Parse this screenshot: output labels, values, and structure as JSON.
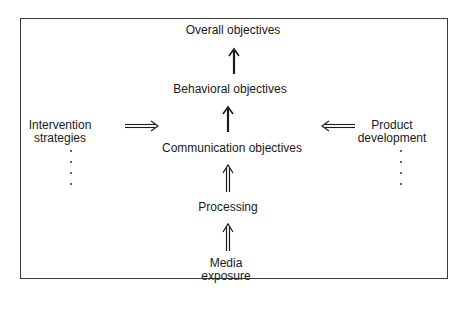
{
  "diagram": {
    "type": "flow-hierarchy",
    "central_chain": [
      {
        "id": "overall",
        "label": "Overall objectives"
      },
      {
        "id": "behavioral",
        "label": "Behavioral objectives"
      },
      {
        "id": "communication",
        "label": "Communication objectives"
      },
      {
        "id": "processing",
        "label": "Processing"
      },
      {
        "id": "media",
        "label_line1": "Media",
        "label_line2": "exposure"
      }
    ],
    "left_input": {
      "label_line1": "Intervention",
      "label_line2": "strategies",
      "continuation": "vertical dots",
      "arrow_direction": "right",
      "target": "Communication objectives"
    },
    "right_input": {
      "label_line1": "Product",
      "label_line2": "development",
      "continuation": "vertical dots",
      "arrow_direction": "left",
      "target": "Communication objectives"
    },
    "edges": [
      {
        "from": "Media exposure",
        "to": "Processing",
        "style": "hollow double-line arrow"
      },
      {
        "from": "Processing",
        "to": "Communication objectives",
        "style": "hollow double-line arrow"
      },
      {
        "from": "Communication objectives",
        "to": "Behavioral objectives",
        "style": "solid arrow"
      },
      {
        "from": "Behavioral objectives",
        "to": "Overall objectives",
        "style": "solid arrow"
      },
      {
        "from": "Intervention strategies",
        "to": "Communication objectives",
        "style": "hollow double-line arrow"
      },
      {
        "from": "Product development",
        "to": "Communication objectives",
        "style": "hollow double-line arrow"
      }
    ],
    "colors": {
      "ink": "#1a1a1a",
      "border": "#3a3a3a",
      "background": "#ffffff"
    }
  }
}
